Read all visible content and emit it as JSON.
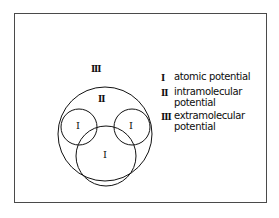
{
  "figure": {
    "background_color": "#ffffff",
    "border_color": "#4a4a4a",
    "stroke_color": "#111111"
  },
  "diagram": {
    "labels": {
      "outer_region": "III",
      "middle_region": "II",
      "atom_left": "I",
      "atom_right": "I",
      "atom_bottom": "I"
    }
  },
  "legend": {
    "entries": [
      {
        "numeral": "I",
        "lines": [
          "atomic potential"
        ]
      },
      {
        "numeral": "II",
        "lines": [
          "intramolecular",
          "potential"
        ]
      },
      {
        "numeral": "III",
        "lines": [
          "extramolecular",
          "potential"
        ]
      }
    ]
  }
}
